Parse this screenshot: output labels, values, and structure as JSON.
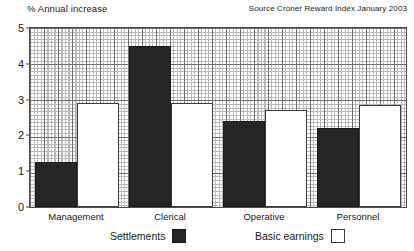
{
  "figure": {
    "axis_title": "% Annual increase",
    "source_note": "Source Croner Reward Index January 2003"
  },
  "legend": {
    "entries": [
      {
        "label": "Settlements",
        "swatch": "settlements",
        "color": "#262626"
      },
      {
        "label": "Basic earnings",
        "swatch": "earnings",
        "color": "#FFFFFF"
      }
    ]
  },
  "yaxis": {
    "ticks": [
      "0",
      "1",
      "2",
      "3",
      "4",
      "5"
    ]
  },
  "chart_data": {
    "type": "bar",
    "title": "",
    "subtitle": "",
    "xlabel": "",
    "ylabel": "% Annual increase",
    "ylim": [
      0,
      5
    ],
    "yticks": [
      0,
      1,
      2,
      3,
      4,
      5
    ],
    "grid": true,
    "grid_style": "fine crosshatch mesh with darker major gridlines at integer units",
    "legend_position": "bottom",
    "annotations": [
      "Source Croner Reward Index January 2003"
    ],
    "categories": [
      "Management",
      "Clerical",
      "Operative",
      "Personnel"
    ],
    "series": [
      {
        "name": "Settlements",
        "color": "#262626",
        "values": [
          1.25,
          4.5,
          2.4,
          2.2
        ]
      },
      {
        "name": "Basic earnings",
        "color": "#FFFFFF",
        "values": [
          2.9,
          2.9,
          2.7,
          2.85
        ]
      }
    ]
  }
}
